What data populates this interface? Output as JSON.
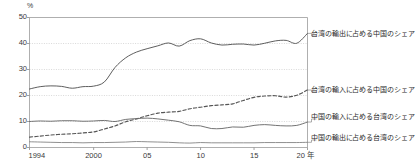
{
  "chart_data": {
    "type": "line",
    "title": "",
    "subtitle": "",
    "xlabel": "年",
    "ylabel": "%",
    "unit": "%",
    "xlim": [
      1994,
      2020
    ],
    "ylim": [
      0,
      50
    ],
    "yticks": [
      "0",
      "10",
      "20",
      "30",
      "40",
      "50"
    ],
    "ytick_values": [
      0,
      10,
      20,
      30,
      40,
      50
    ],
    "xticks": [
      "1994",
      "2000",
      "05",
      "10",
      "15",
      "20 年"
    ],
    "xtick_values": [
      1994,
      2000,
      2005,
      2010,
      2015,
      2020
    ],
    "grid": true,
    "grid_style": "dotted-horizontal",
    "legend_position": "right",
    "x": [
      1994,
      1995,
      1996,
      1997,
      1998,
      1999,
      2000,
      2001,
      2002,
      2003,
      2004,
      2005,
      2006,
      2007,
      2008,
      2009,
      2010,
      2011,
      2012,
      2013,
      2014,
      2015,
      2016,
      2017,
      2018,
      2019,
      2020
    ],
    "series": [
      {
        "name": "台湾の輸出に占める中国のシェア",
        "style": "solid",
        "color": "#555555",
        "values": [
          22.5,
          23.4,
          23.7,
          23.5,
          22.8,
          23.4,
          23.6,
          25.2,
          30.8,
          34.5,
          36.7,
          38.0,
          39.1,
          40.2,
          39.0,
          41.1,
          41.8,
          40.2,
          39.4,
          39.7,
          39.8,
          39.4,
          40.1,
          41.0,
          41.2,
          40.1,
          43.9
        ]
      },
      {
        "name": "台湾の輸入に占める中国のシェア",
        "style": "dashed",
        "color": "#555555",
        "values": [
          4.0,
          4.4,
          4.8,
          5.1,
          5.3,
          5.6,
          6.0,
          7.1,
          8.3,
          9.9,
          11.0,
          12.2,
          13.2,
          13.6,
          13.9,
          14.9,
          15.5,
          16.1,
          16.4,
          16.8,
          18.1,
          19.3,
          19.8,
          19.9,
          19.4,
          20.1,
          22.1
        ]
      },
      {
        "name": "中国の輸入に占める台湾のシェア",
        "style": "solid",
        "color": "#6b6b6b",
        "values": [
          10.0,
          10.2,
          10.1,
          10.3,
          10.3,
          10.1,
          10.2,
          10.4,
          10.0,
          10.8,
          11.1,
          11.3,
          11.0,
          10.5,
          9.9,
          8.5,
          8.3,
          7.3,
          7.3,
          7.9,
          7.8,
          8.5,
          8.8,
          8.5,
          8.3,
          8.5,
          9.8
        ]
      },
      {
        "name": "中国の輸出に占める台湾のシェア",
        "style": "solid",
        "color": "#8a8a8a",
        "values": [
          2.2,
          2.1,
          2.0,
          1.9,
          1.9,
          1.8,
          1.9,
          1.9,
          2.0,
          2.1,
          2.3,
          2.2,
          2.1,
          2.0,
          1.8,
          1.7,
          1.9,
          1.8,
          1.8,
          1.8,
          1.8,
          1.8,
          1.9,
          1.9,
          1.9,
          1.9,
          2.0
        ]
      }
    ],
    "legend": [
      "台湾の輸出に占める中国のシェア",
      "台湾の輸入に占める中国のシェア",
      "中国の輸入に占める台湾のシェア",
      "中国の輸出に占める台湾のシェア"
    ]
  },
  "axis": {
    "unit_top": "%",
    "y_labels": [
      "50",
      "40",
      "30",
      "20",
      "10",
      "0"
    ],
    "x_labels": [
      "1994",
      "2000",
      "05",
      "10",
      "15",
      "20 年"
    ]
  },
  "legend_labels": {
    "tw_export_to_cn": "台湾の輸出に占める中国のシェア",
    "tw_import_from_cn": "台湾の輸入に占める中国のシェア",
    "cn_import_from_tw": "中国の輸入に占める台湾のシェア",
    "cn_export_to_tw": "中国の輸出に占める台湾のシェア"
  }
}
